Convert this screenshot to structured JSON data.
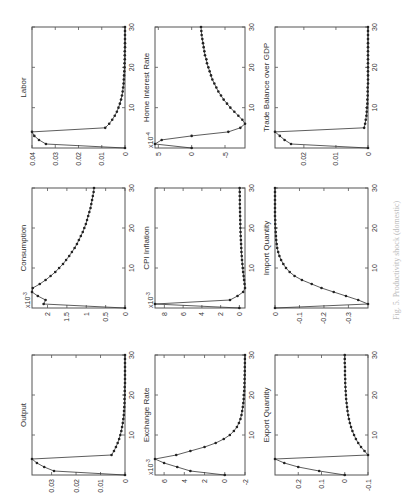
{
  "figure": {
    "orientation": "rotated 90deg counter-clockwise",
    "caption": "Fig. 5. Productivity shock (domestic)",
    "line_color": "#333333",
    "marker_color": "#222222",
    "frame_color": "#555555"
  },
  "chart_data": [
    {
      "type": "line",
      "title": "Output",
      "position": "bottom-left",
      "x": [
        0,
        1,
        2,
        3,
        4,
        5,
        6,
        7,
        8,
        9,
        10,
        11,
        12,
        13,
        14,
        15,
        16,
        17,
        18,
        19,
        20,
        21,
        22,
        23,
        24,
        25,
        26,
        27,
        28,
        29,
        30
      ],
      "values": [
        0,
        0.029,
        0.033,
        0.036,
        0.038,
        0.0055,
        0.0045,
        0.0037,
        0.003,
        0.0024,
        0.0019,
        0.0015,
        0.0012,
        0.0009,
        0.0007,
        0.0005,
        0.0004,
        0.0003,
        0.0002,
        0.0002,
        0.0001,
        0.0001,
        0.0001,
        0,
        0,
        0,
        0,
        0,
        0,
        0,
        0
      ],
      "yticks": [
        "0",
        "0.01",
        "0.02",
        "0.03"
      ],
      "ylim": [
        0,
        0.038
      ],
      "xticks": [
        "10",
        "20",
        "30"
      ],
      "xlim": [
        0,
        30
      ],
      "exponent": ""
    },
    {
      "type": "line",
      "title": "Exchange Rate",
      "position": "bottom-middle",
      "x": [
        0,
        1,
        2,
        3,
        4,
        5,
        6,
        7,
        8,
        9,
        10,
        11,
        12,
        13,
        14,
        15,
        16,
        17,
        18,
        19,
        20,
        21,
        22,
        23,
        24,
        25,
        26,
        27,
        28,
        29,
        30
      ],
      "values": [
        0,
        3.4,
        4.7,
        6.0,
        6.9,
        4.8,
        3.4,
        2.0,
        0.9,
        0.1,
        -0.5,
        -0.9,
        -1.2,
        -1.4,
        -1.55,
        -1.65,
        -1.72,
        -1.78,
        -1.83,
        -1.87,
        -1.9,
        -1.92,
        -1.94,
        -1.95,
        -1.96,
        -1.97,
        -1.98,
        -1.98,
        -1.99,
        -1.99,
        -2.0
      ],
      "yticks": [
        "-2",
        "0",
        "2",
        "4",
        "6"
      ],
      "ylim": [
        -2,
        6.9
      ],
      "xticks": [
        "10",
        "20",
        "30"
      ],
      "xlim": [
        0,
        30
      ],
      "exponent": "x10^-3"
    },
    {
      "type": "line",
      "title": "Export Quantity",
      "position": "bottom-right",
      "x": [
        0,
        1,
        2,
        3,
        4,
        5,
        6,
        7,
        8,
        9,
        10,
        11,
        12,
        13,
        14,
        15,
        16,
        17,
        18,
        19,
        20,
        21,
        22,
        23,
        24,
        25,
        26,
        27,
        28,
        29,
        30
      ],
      "values": [
        0,
        0.11,
        0.2,
        0.26,
        0.3,
        -0.1,
        -0.085,
        -0.07,
        -0.058,
        -0.048,
        -0.04,
        -0.033,
        -0.027,
        -0.022,
        -0.018,
        -0.015,
        -0.012,
        -0.01,
        -0.008,
        -0.006,
        -0.005,
        -0.004,
        -0.003,
        -0.002,
        -0.002,
        -0.001,
        -0.001,
        -0.001,
        0,
        0,
        0
      ],
      "yticks": [
        "-0.1",
        "0",
        "0.1",
        "0.2"
      ],
      "ylim": [
        -0.1,
        0.3
      ],
      "xticks": [
        "10",
        "20",
        "30"
      ],
      "xlim": [
        0,
        30
      ],
      "exponent": ""
    },
    {
      "type": "line",
      "title": "Consumption",
      "position": "middle-left",
      "x": [
        0,
        1,
        2,
        3,
        4,
        5,
        6,
        7,
        8,
        9,
        10,
        11,
        12,
        13,
        14,
        15,
        16,
        17,
        18,
        19,
        20,
        21,
        22,
        23,
        24,
        25,
        26,
        27,
        28,
        29,
        30
      ],
      "values": [
        0,
        2.1,
        2.05,
        2.25,
        2.4,
        2.38,
        2.2,
        2.05,
        1.92,
        1.8,
        1.7,
        1.6,
        1.52,
        1.44,
        1.37,
        1.3,
        1.24,
        1.19,
        1.14,
        1.09,
        1.05,
        1.01,
        0.98,
        0.95,
        0.92,
        0.89,
        0.87,
        0.85,
        0.83,
        0.81,
        0.8
      ],
      "yticks": [
        "0",
        "0.5",
        "1",
        "1.5",
        "2"
      ],
      "ylim": [
        0,
        2.4
      ],
      "xticks": [
        "10",
        "20",
        "30"
      ],
      "xlim": [
        0,
        30
      ],
      "exponent": "x10^-3"
    },
    {
      "type": "line",
      "title": "CPI Inflation",
      "position": "middle-middle",
      "x": [
        0,
        1,
        2,
        3,
        4,
        5,
        6,
        7,
        8,
        9,
        10,
        11,
        12,
        13,
        14,
        15,
        16,
        17,
        18,
        19,
        20,
        21,
        22,
        23,
        24,
        25,
        26,
        27,
        28,
        29,
        30
      ],
      "values": [
        0,
        9,
        1.0,
        0.2,
        -0.4,
        -0.6,
        -0.55,
        -0.5,
        -0.45,
        -0.4,
        -0.36,
        -0.32,
        -0.28,
        -0.25,
        -0.22,
        -0.2,
        -0.18,
        -0.16,
        -0.14,
        -0.12,
        -0.11,
        -0.1,
        -0.09,
        -0.08,
        -0.07,
        -0.06,
        -0.05,
        -0.05,
        -0.04,
        -0.04,
        -0.03
      ],
      "yticks": [
        "0",
        "2",
        "4",
        "6",
        "8"
      ],
      "ylim": [
        -0.6,
        9
      ],
      "xticks": [
        "10",
        "20",
        "30"
      ],
      "xlim": [
        0,
        30
      ],
      "exponent": "x10^-3"
    },
    {
      "type": "line",
      "title": "Import Quantity",
      "position": "middle-right",
      "x": [
        0,
        1,
        2,
        3,
        4,
        5,
        6,
        7,
        8,
        9,
        10,
        11,
        12,
        13,
        14,
        15,
        16,
        17,
        18,
        19,
        20,
        21,
        22,
        23,
        24,
        25,
        26,
        27,
        28,
        29,
        30
      ],
      "values": [
        0,
        -0.38,
        -0.34,
        -0.29,
        -0.24,
        -0.19,
        -0.15,
        -0.11,
        -0.08,
        -0.06,
        -0.045,
        -0.034,
        -0.025,
        -0.018,
        -0.013,
        -0.009,
        -0.007,
        -0.005,
        -0.004,
        -0.003,
        -0.002,
        -0.001,
        -0.001,
        0,
        0,
        0,
        0,
        0,
        0,
        0,
        0
      ],
      "yticks": [
        "-0.3",
        "-0.2",
        "-0.1",
        "0"
      ],
      "ylim": [
        -0.38,
        0
      ],
      "xticks": [
        "10",
        "20",
        "30"
      ],
      "xlim": [
        0,
        30
      ],
      "exponent": ""
    },
    {
      "type": "line",
      "title": "Labor",
      "position": "top-left",
      "x": [
        0,
        1,
        2,
        3,
        4,
        5,
        6,
        7,
        8,
        9,
        10,
        11,
        12,
        13,
        14,
        15,
        16,
        17,
        18,
        19,
        20,
        21,
        22,
        23,
        24,
        25,
        26,
        27,
        28,
        29,
        30
      ],
      "values": [
        0,
        0.034,
        0.037,
        0.039,
        0.04,
        0.0085,
        0.0068,
        0.0055,
        0.0044,
        0.0035,
        0.0028,
        0.0022,
        0.0017,
        0.0013,
        0.001,
        0.0008,
        0.0006,
        0.0005,
        0.0004,
        0.0003,
        0.0002,
        0.0002,
        0.0001,
        0.0001,
        0.0001,
        0,
        0,
        0,
        0,
        0,
        0
      ],
      "yticks": [
        "0",
        "0.01",
        "0.02",
        "0.03",
        "0.04"
      ],
      "ylim": [
        0,
        0.04
      ],
      "xticks": [
        "10",
        "20",
        "30"
      ],
      "xlim": [
        0,
        30
      ],
      "exponent": ""
    },
    {
      "type": "line",
      "title": "Home Interest Rate",
      "position": "top-middle",
      "x": [
        0,
        1,
        2,
        3,
        4,
        5,
        6,
        7,
        8,
        9,
        10,
        11,
        12,
        13,
        14,
        15,
        16,
        17,
        18,
        19,
        20,
        21,
        22,
        23,
        24,
        25,
        26,
        27,
        28,
        29,
        30
      ],
      "values": [
        0,
        5.5,
        4.5,
        0,
        -5.5,
        -7.3,
        -8.0,
        -7.6,
        -7.0,
        -6.4,
        -5.8,
        -5.3,
        -4.8,
        -4.4,
        -4.0,
        -3.7,
        -3.4,
        -3.1,
        -2.9,
        -2.7,
        -2.5,
        -2.3,
        -2.2,
        -2.0,
        -1.9,
        -1.8,
        -1.7,
        -1.6,
        -1.5,
        -1.45,
        -1.4
      ],
      "yticks": [
        "-5",
        "0",
        "5"
      ],
      "ylim": [
        -8,
        5.5
      ],
      "xticks": [
        "10",
        "20",
        "30"
      ],
      "xlim": [
        0,
        30
      ],
      "exponent": "x10^-4"
    },
    {
      "type": "line",
      "title": "Trade Balance over GDP",
      "position": "top-right",
      "x": [
        0,
        1,
        2,
        3,
        4,
        5,
        6,
        7,
        8,
        9,
        10,
        11,
        12,
        13,
        14,
        15,
        16,
        17,
        18,
        19,
        20,
        21,
        22,
        23,
        24,
        25,
        26,
        27,
        28,
        29,
        30
      ],
      "values": [
        0,
        0.024,
        0.026,
        0.0275,
        0.029,
        0.0012,
        0.0009,
        0.0007,
        0.0005,
        0.0004,
        0.0003,
        0.0002,
        0.0002,
        0.0001,
        0.0001,
        0.0001,
        0,
        0,
        0,
        0,
        0,
        0,
        0,
        0,
        0,
        0,
        0,
        0,
        0,
        0,
        0
      ],
      "yticks": [
        "0",
        "0.01",
        "0.02"
      ],
      "ylim": [
        0,
        0.029
      ],
      "xticks": [
        "10",
        "20",
        "30"
      ],
      "xlim": [
        0,
        30
      ],
      "exponent": ""
    }
  ]
}
